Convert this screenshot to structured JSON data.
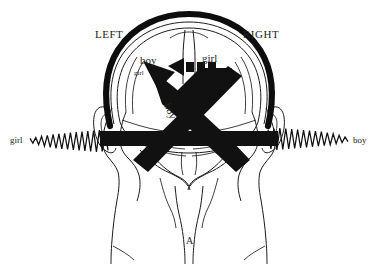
{
  "figure": {
    "panel_label": "A",
    "hemisphere_labels": {
      "left": "LEFT",
      "right": "RIGHT"
    },
    "brain_labels": {
      "left_large": "boy",
      "left_small": "girl",
      "right_large": "girl",
      "diagonal": "boy"
    },
    "ear_inputs": {
      "left": "girl",
      "right": "boy"
    },
    "colors": {
      "ink": "#111111",
      "outline": "#1b1b1b",
      "background": "#ffffff",
      "text": "#232323"
    }
  },
  "chart_data": {
    "type": "diagram",
    "panel": "A",
    "annotations": [
      {
        "name": "LEFT",
        "x": 118,
        "y": 35,
        "role": "hemisphere-label"
      },
      {
        "name": "RIGHT",
        "x": 265,
        "y": 35,
        "role": "hemisphere-label"
      },
      {
        "name": "boy",
        "x": 150,
        "y": 62,
        "role": "stimulus-in-left-hemisphere"
      },
      {
        "name": "girl",
        "x": 141,
        "y": 73,
        "role": "weak-stimulus-in-left-hemisphere"
      },
      {
        "name": "girl",
        "x": 210,
        "y": 61,
        "role": "stimulus-in-right-hemisphere"
      },
      {
        "name": "boy",
        "x": 172,
        "y": 103,
        "role": "diagonal-pathway-label"
      },
      {
        "name": "girl",
        "x": 14,
        "y": 140,
        "role": "left-ear-input"
      },
      {
        "name": "boy",
        "x": 362,
        "y": 140,
        "role": "right-ear-input"
      },
      {
        "name": "A",
        "x": 190,
        "y": 241,
        "role": "panel-label"
      }
    ],
    "waveforms": [
      {
        "name": "left-ear-waveform",
        "side": "left",
        "label": "girl",
        "x_start": 30,
        "x_end": 108,
        "baseline_y": 140,
        "amplitudes": [
          3,
          6,
          5,
          9,
          7,
          12,
          9,
          14,
          11,
          16,
          12,
          17,
          13,
          18,
          14,
          19,
          15,
          20,
          16,
          21,
          17,
          22,
          18,
          23,
          19,
          22,
          17,
          20
        ]
      },
      {
        "name": "right-ear-waveform",
        "side": "right",
        "label": "boy",
        "x_start": 268,
        "x_end": 348,
        "baseline_y": 140,
        "amplitudes": [
          20,
          17,
          22,
          19,
          23,
          18,
          22,
          17,
          21,
          16,
          20,
          15,
          19,
          14,
          18,
          13,
          17,
          12,
          16,
          11,
          14,
          9,
          12,
          7,
          9,
          5,
          6,
          3
        ]
      }
    ],
    "pathways": [
      {
        "name": "left-ear-to-right-hemisphere",
        "from": "left ear",
        "to": "right hemisphere",
        "style": "thick black arrow"
      },
      {
        "name": "right-ear-to-left-hemisphere",
        "from": "right ear",
        "to": "left hemisphere",
        "style": "thick black arrow"
      },
      {
        "name": "interhemispheric-transfer",
        "from": "right hemisphere",
        "to": "left hemisphere",
        "style": "dashed horizontal arrow"
      }
    ]
  }
}
